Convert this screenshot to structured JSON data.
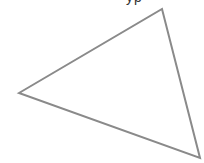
{
  "diagram": {
    "shape": "triangle",
    "vertices": [
      [
        19,
        93
      ],
      [
        162,
        9
      ],
      [
        200,
        158
      ]
    ],
    "stroke_color": "#8a8a8a",
    "stroke_width": 2,
    "fill": "#ffffff"
  },
  "clipped_label": {
    "text": "yp"
  }
}
